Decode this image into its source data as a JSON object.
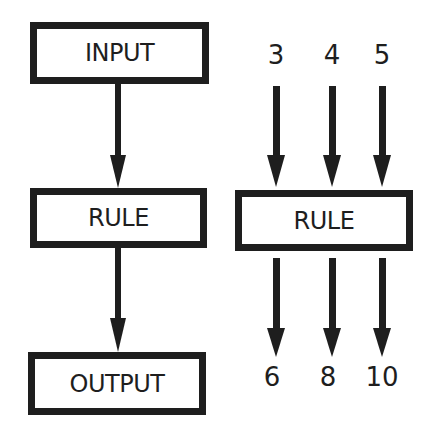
{
  "diagram": {
    "left_flow": {
      "input_label": "INPUT",
      "rule_label": "RULE",
      "output_label": "OUTPUT"
    },
    "right_flow": {
      "inputs": [
        "3",
        "4",
        "5"
      ],
      "rule_label": "RULE",
      "outputs": [
        "6",
        "8",
        "10"
      ]
    },
    "colors": {
      "stroke": "#1e1e1e",
      "background": "#ffffff"
    }
  }
}
